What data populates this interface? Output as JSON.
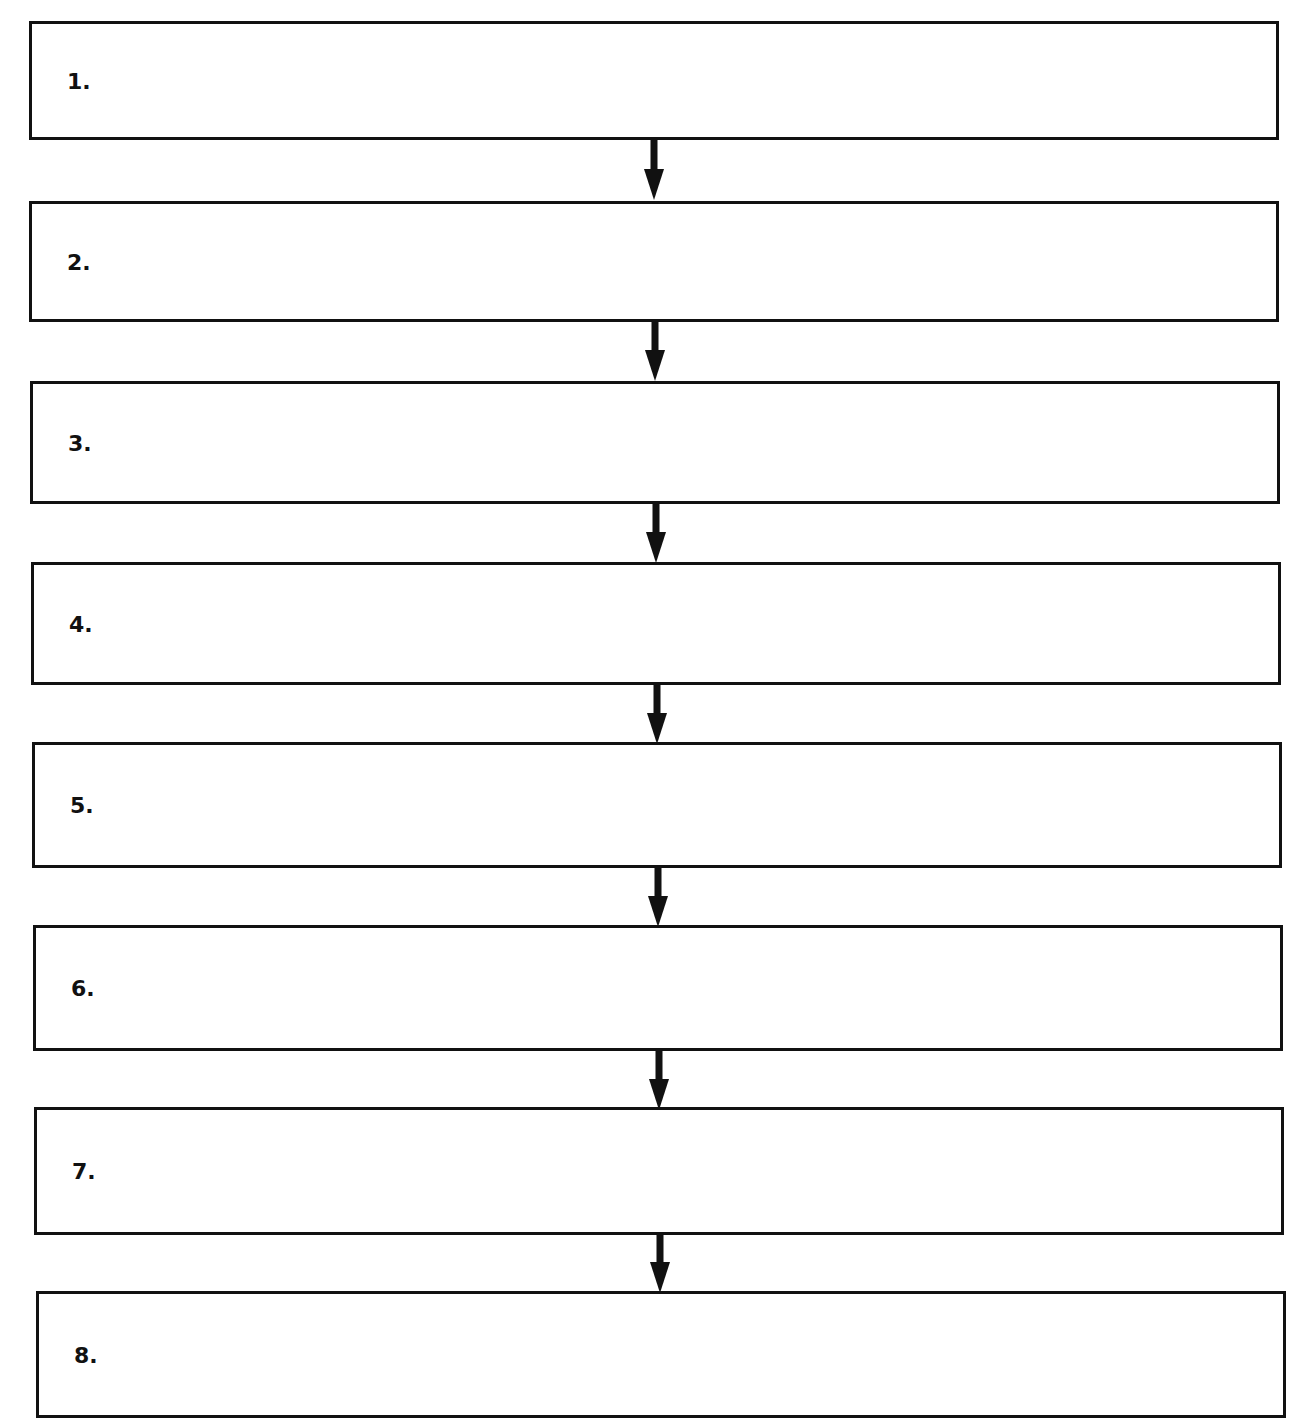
{
  "flowchart": {
    "steps": [
      {
        "label": "1."
      },
      {
        "label": "2."
      },
      {
        "label": "3."
      },
      {
        "label": "4."
      },
      {
        "label": "5."
      },
      {
        "label": "6."
      },
      {
        "label": "7."
      },
      {
        "label": "8."
      }
    ],
    "arrow_count": 7,
    "colors": {
      "stroke": "#111111",
      "background": "#ffffff"
    }
  }
}
